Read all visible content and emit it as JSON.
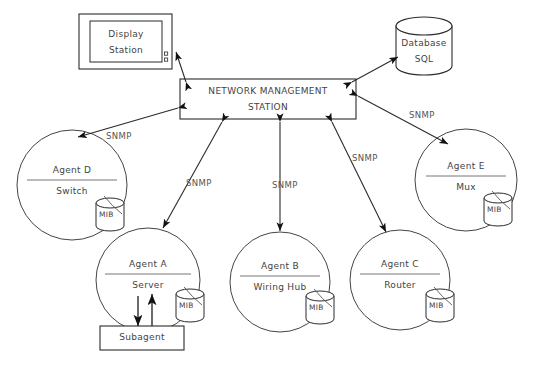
{
  "diagram": {
    "center": {
      "label_line1": "NETWORK MANAGEMENT",
      "label_line2": "STATION"
    },
    "display_station": {
      "label_line1": "Display",
      "label_line2": "Station"
    },
    "database": {
      "label_line1": "Database",
      "label_line2": "SQL"
    },
    "subagent": {
      "label": "Subagent"
    },
    "agents": [
      {
        "id": "agent-d",
        "name": "Agent D",
        "role": "Switch",
        "mib": "MIB"
      },
      {
        "id": "agent-a",
        "name": "Agent A",
        "role": "Server",
        "mib": "MIB"
      },
      {
        "id": "agent-b",
        "name": "Agent B",
        "role": "Wiring Hub",
        "mib": "MIB"
      },
      {
        "id": "agent-c",
        "name": "Agent C",
        "role": "Router",
        "mib": "MIB"
      },
      {
        "id": "agent-e",
        "name": "Agent E",
        "role": "Mux",
        "mib": "MIB"
      }
    ],
    "protocol_labels": [
      {
        "id": "snmp-d",
        "text": "SNMP"
      },
      {
        "id": "snmp-a",
        "text": "SNMP"
      },
      {
        "id": "snmp-b",
        "text": "SNMP"
      },
      {
        "id": "snmp-c",
        "text": "SNMP"
      },
      {
        "id": "snmp-e",
        "text": "SNMP"
      }
    ],
    "colors": {
      "line": "#2b2b2b",
      "text": "#444444",
      "label": "#555555",
      "background": "#ffffff"
    }
  }
}
